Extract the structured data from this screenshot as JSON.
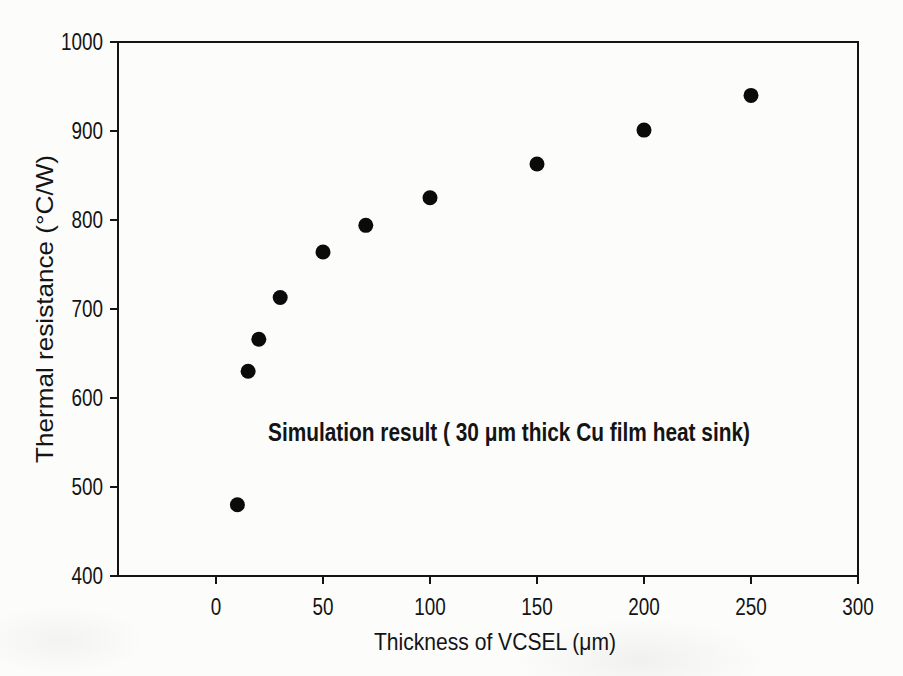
{
  "colors": {
    "ink": "#141414",
    "marker": "#0b0b0b",
    "paper": "#fcfcfb"
  },
  "chart_data": {
    "type": "scatter",
    "title": "",
    "xlabel": "Thickness of VCSEL (μm)",
    "ylabel": "Thermal resistance (°C/W)",
    "annotation": "Simulation result ( 30 μm thick Cu film heat sink)",
    "x_ticks": [
      0,
      50,
      100,
      150,
      200,
      250,
      300
    ],
    "y_ticks": [
      400,
      500,
      600,
      700,
      800,
      900,
      1000
    ],
    "xlim": [
      -46,
      300
    ],
    "ylim": [
      400,
      1000
    ],
    "grid": false,
    "legend_position": "none",
    "marker_shape": "filled-circle",
    "series": [
      {
        "name": "Simulation result (30 μm thick Cu film heat sink)",
        "x": [
          10,
          15,
          20,
          30,
          50,
          70,
          100,
          150,
          200,
          250
        ],
        "y": [
          480,
          630,
          666,
          713,
          764,
          794,
          825,
          863,
          901,
          940
        ]
      }
    ]
  }
}
